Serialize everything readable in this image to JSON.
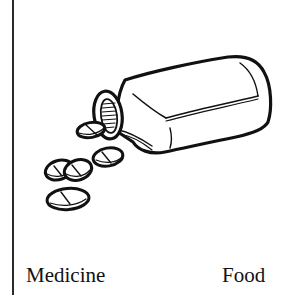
{
  "card": {
    "illustration": {
      "subject": "pill-bottle-with-spilled-pills",
      "icon": "medicine-bottle-icon",
      "pill_count_spilled": 5
    },
    "labels": {
      "left": "Medicine",
      "right": "Food"
    },
    "colors": {
      "ink": "#111111",
      "background": "#ffffff",
      "divider": "#2a2a2a"
    }
  }
}
